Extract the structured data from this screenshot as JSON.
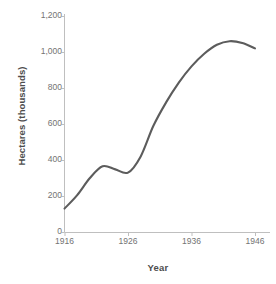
{
  "chart_data": {
    "type": "line",
    "title": "",
    "xlabel": "Year",
    "ylabel": "Hectares (thousands)",
    "xlim": [
      1915,
      1947
    ],
    "ylim": [
      0,
      1200
    ],
    "grid": false,
    "legend": null,
    "line_color": "#5c5c5c",
    "axis_color": "#bfbfbf",
    "xticks": [
      1916,
      1926,
      1936,
      1946
    ],
    "xtick_labels": [
      "1916",
      "1926",
      "1936",
      "1946"
    ],
    "yticks": [
      0,
      200,
      400,
      600,
      800,
      1000,
      1200
    ],
    "ytick_labels": [
      "0",
      "200",
      "400",
      "600",
      "800",
      "1,000",
      "1,200"
    ],
    "series": [
      {
        "name": "Hectares",
        "x": [
          1916,
          1918,
          1920,
          1922,
          1924,
          1926,
          1928,
          1930,
          1932,
          1934,
          1936,
          1938,
          1940,
          1942,
          1944,
          1946
        ],
        "values": [
          130,
          205,
          300,
          365,
          348,
          330,
          420,
          590,
          720,
          830,
          920,
          990,
          1040,
          1060,
          1050,
          1020
        ]
      }
    ]
  }
}
